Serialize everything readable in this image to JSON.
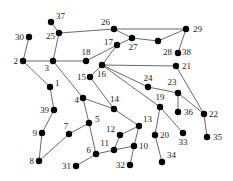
{
  "graph": {
    "nodes": [
      {
        "id": "1",
        "x": 50,
        "y": 87,
        "lx": 55,
        "ly": 86,
        "anchor": "start"
      },
      {
        "id": "2",
        "x": 23,
        "y": 61,
        "lx": 18,
        "ly": 64,
        "anchor": "end"
      },
      {
        "id": "3",
        "x": 53,
        "y": 61,
        "lx": 49,
        "ly": 71,
        "anchor": "end"
      },
      {
        "id": "4",
        "x": 83,
        "y": 98,
        "lx": 79,
        "ly": 103,
        "anchor": "end"
      },
      {
        "id": "5",
        "x": 89,
        "y": 123,
        "lx": 95,
        "ly": 122,
        "anchor": "start"
      },
      {
        "id": "6",
        "x": 96,
        "y": 154,
        "lx": 91,
        "ly": 153,
        "anchor": "end"
      },
      {
        "id": "7",
        "x": 69,
        "y": 134,
        "lx": 66,
        "ly": 129,
        "anchor": "middle"
      },
      {
        "id": "8",
        "x": 39,
        "y": 161,
        "lx": 34,
        "ly": 164,
        "anchor": "end"
      },
      {
        "id": "9",
        "x": 42,
        "y": 133,
        "lx": 37,
        "ly": 136,
        "anchor": "end"
      },
      {
        "id": "10",
        "x": 134,
        "y": 146,
        "lx": 139,
        "ly": 149,
        "anchor": "start"
      },
      {
        "id": "11",
        "x": 114,
        "y": 150,
        "lx": 109,
        "ly": 146,
        "anchor": "end"
      },
      {
        "id": "12",
        "x": 120,
        "y": 135,
        "lx": 115,
        "ly": 132,
        "anchor": "end"
      },
      {
        "id": "13",
        "x": 139,
        "y": 126,
        "lx": 143,
        "ly": 122,
        "anchor": "start"
      },
      {
        "id": "14",
        "x": 114,
        "y": 109,
        "lx": 110,
        "ly": 102,
        "anchor": "start"
      },
      {
        "id": "15",
        "x": 90,
        "y": 77,
        "lx": 86,
        "ly": 80,
        "anchor": "end"
      },
      {
        "id": "16",
        "x": 102,
        "y": 65,
        "lx": 97,
        "ly": 77,
        "anchor": "start"
      },
      {
        "id": "17",
        "x": 117,
        "y": 45,
        "lx": 113,
        "ly": 45,
        "anchor": "end"
      },
      {
        "id": "18",
        "x": 86,
        "y": 61,
        "lx": 86,
        "ly": 55,
        "anchor": "middle"
      },
      {
        "id": "19",
        "x": 160,
        "y": 107,
        "lx": 160,
        "ly": 100,
        "anchor": "middle"
      },
      {
        "id": "20",
        "x": 155,
        "y": 135,
        "lx": 160,
        "ly": 138,
        "anchor": "start"
      },
      {
        "id": "21",
        "x": 176,
        "y": 66,
        "lx": 182,
        "ly": 69,
        "anchor": "start"
      },
      {
        "id": "22",
        "x": 204,
        "y": 114,
        "lx": 209,
        "ly": 117,
        "anchor": "start"
      },
      {
        "id": "23",
        "x": 178,
        "y": 93,
        "lx": 172,
        "ly": 85,
        "anchor": "middle"
      },
      {
        "id": "24",
        "x": 148,
        "y": 87,
        "lx": 148,
        "ly": 81,
        "anchor": "middle"
      },
      {
        "id": "25",
        "x": 59,
        "y": 33,
        "lx": 55,
        "ly": 39,
        "anchor": "end"
      },
      {
        "id": "26",
        "x": 114,
        "y": 29,
        "lx": 110,
        "ly": 25,
        "anchor": "end"
      },
      {
        "id": "27",
        "x": 132,
        "y": 38,
        "lx": 133,
        "ly": 50,
        "anchor": "middle"
      },
      {
        "id": "28",
        "x": 158,
        "y": 41,
        "lx": 172,
        "ly": 55,
        "anchor": "end"
      },
      {
        "id": "29",
        "x": 186,
        "y": 29,
        "lx": 193,
        "ly": 32,
        "anchor": "start"
      },
      {
        "id": "30",
        "x": 29,
        "y": 37,
        "lx": 24,
        "ly": 40,
        "anchor": "end"
      },
      {
        "id": "31",
        "x": 76,
        "y": 166,
        "lx": 71,
        "ly": 169,
        "anchor": "end"
      },
      {
        "id": "32",
        "x": 130,
        "y": 165,
        "lx": 125,
        "ly": 168,
        "anchor": "end"
      },
      {
        "id": "33",
        "x": 183,
        "y": 133,
        "lx": 183,
        "ly": 145,
        "anchor": "middle"
      },
      {
        "id": "34",
        "x": 162,
        "y": 162,
        "lx": 167,
        "ly": 158,
        "anchor": "start"
      },
      {
        "id": "35",
        "x": 207,
        "y": 137,
        "lx": 213,
        "ly": 140,
        "anchor": "start"
      },
      {
        "id": "36",
        "x": 178,
        "y": 112,
        "lx": 184,
        "ly": 115,
        "anchor": "start"
      },
      {
        "id": "37",
        "x": 51,
        "y": 22,
        "lx": 56,
        "ly": 19,
        "anchor": "start"
      },
      {
        "id": "38",
        "x": 178,
        "y": 53,
        "lx": 182,
        "ly": 55,
        "anchor": "start"
      },
      {
        "id": "39",
        "x": 54,
        "y": 110,
        "lx": 49,
        "ly": 113,
        "anchor": "end"
      }
    ],
    "edges": [
      [
        "37",
        "25"
      ],
      [
        "25",
        "3"
      ],
      [
        "25",
        "26"
      ],
      [
        "30",
        "2"
      ],
      [
        "2",
        "3"
      ],
      [
        "2",
        "1"
      ],
      [
        "3",
        "18"
      ],
      [
        "3",
        "4"
      ],
      [
        "18",
        "17"
      ],
      [
        "26",
        "29"
      ],
      [
        "26",
        "27"
      ],
      [
        "27",
        "17"
      ],
      [
        "27",
        "28"
      ],
      [
        "28",
        "29"
      ],
      [
        "29",
        "38"
      ],
      [
        "17",
        "16"
      ],
      [
        "16",
        "15"
      ],
      [
        "16",
        "21"
      ],
      [
        "16",
        "24"
      ],
      [
        "16",
        "19"
      ],
      [
        "15",
        "14"
      ],
      [
        "21",
        "22"
      ],
      [
        "24",
        "23"
      ],
      [
        "23",
        "36"
      ],
      [
        "23",
        "22"
      ],
      [
        "22",
        "35"
      ],
      [
        "19",
        "20"
      ],
      [
        "19",
        "33"
      ],
      [
        "20",
        "34"
      ],
      [
        "1",
        "39"
      ],
      [
        "39",
        "9"
      ],
      [
        "9",
        "8"
      ],
      [
        "8",
        "7"
      ],
      [
        "7",
        "5"
      ],
      [
        "4",
        "5"
      ],
      [
        "4",
        "14"
      ],
      [
        "5",
        "6"
      ],
      [
        "6",
        "31"
      ],
      [
        "6",
        "11"
      ],
      [
        "11",
        "10"
      ],
      [
        "11",
        "12"
      ],
      [
        "12",
        "13"
      ],
      [
        "13",
        "10"
      ],
      [
        "14",
        "13"
      ],
      [
        "10",
        "32"
      ]
    ]
  }
}
